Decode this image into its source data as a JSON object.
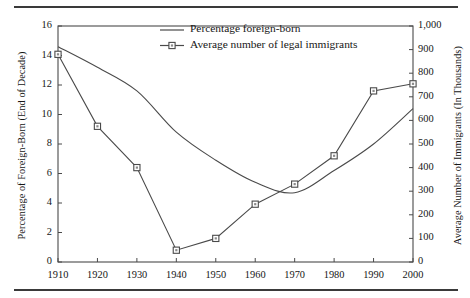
{
  "figure": {
    "rule_top": "horizontal-rule",
    "rule_bottom": "horizontal-rule"
  },
  "chart_data": {
    "type": "line",
    "title": "",
    "xlabel": "",
    "ylabel": "Percentage of Foreign-Born (End of Decade)",
    "y2label": "Average Number of Immigrants (In Thousands)",
    "categories": [
      "1910",
      "1920",
      "1930",
      "1940",
      "1950",
      "1960",
      "1970",
      "1980",
      "1990",
      "2000"
    ],
    "x": [
      1910,
      1920,
      1930,
      1940,
      1950,
      1960,
      1970,
      1980,
      1990,
      2000
    ],
    "xlim": [
      1910,
      2000
    ],
    "ylim": [
      0,
      16
    ],
    "y2lim": [
      0,
      1000
    ],
    "yticks": [
      "0",
      "2",
      "4",
      "6",
      "8",
      "10",
      "12",
      "14",
      "16"
    ],
    "ytick_values": [
      0,
      2,
      4,
      6,
      8,
      10,
      12,
      14,
      16
    ],
    "y2ticks": [
      "0",
      "100",
      "200",
      "300",
      "400",
      "500",
      "600",
      "700",
      "800",
      "900",
      "1,000"
    ],
    "y2tick_values": [
      0,
      100,
      200,
      300,
      400,
      500,
      600,
      700,
      800,
      900,
      1000
    ],
    "grid": false,
    "legend_position": "top-center",
    "series": [
      {
        "name": "Percentage foreign-born",
        "axis": "left",
        "marker": "none",
        "color": "#4a4a4a",
        "values": [
          14.6,
          13.2,
          11.6,
          8.8,
          6.9,
          5.4,
          4.7,
          6.2,
          8.0,
          10.4
        ]
      },
      {
        "name": "Average number of legal immigrants",
        "axis": "right",
        "marker": "square",
        "color": "#4a4a4a",
        "values": [
          880,
          575,
          400,
          50,
          100,
          245,
          330,
          450,
          725,
          755
        ]
      }
    ]
  }
}
